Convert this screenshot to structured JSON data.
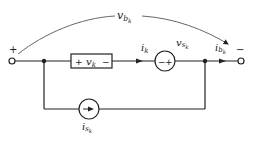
{
  "diagram": {
    "type": "circuit-branch",
    "terminals": {
      "plus": "+",
      "minus": "−"
    },
    "branch_voltage": {
      "symbol": "v",
      "subscript": "b",
      "subsub": "k"
    },
    "element": {
      "plus": "+",
      "symbol": "v",
      "subscript": "k",
      "minus": "−"
    },
    "element_current": {
      "symbol": "i",
      "subscript": "k"
    },
    "voltage_source": {
      "symbol": "v",
      "subscript": "s",
      "subsub": "k",
      "minus": "−",
      "plus": "+"
    },
    "branch_current": {
      "symbol": "i",
      "subscript": "b",
      "subsub": "k"
    },
    "current_source": {
      "symbol": "i",
      "subscript": "s",
      "subsub": "k"
    },
    "colors": {
      "line": "#222222",
      "arc": "#555555",
      "background": "#ffffff"
    }
  }
}
